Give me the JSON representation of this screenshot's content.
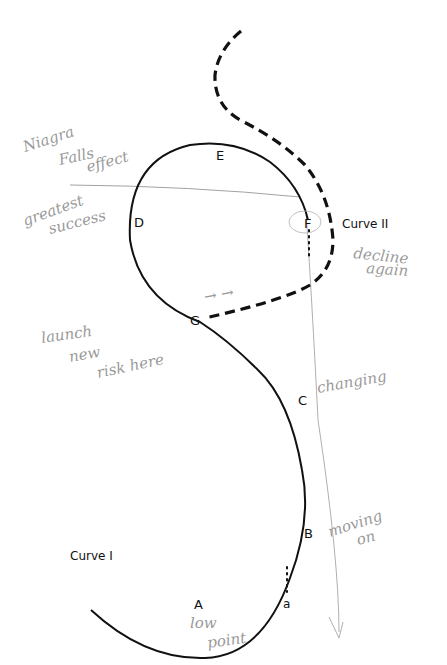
{
  "diagram": {
    "type": "sigmoid-curve-diagram",
    "curves": [
      {
        "name": "Curve I",
        "style": "solid"
      },
      {
        "name": "Curve II",
        "style": "dashed"
      }
    ],
    "points": {
      "A": "A",
      "B": "B",
      "C": "C",
      "D": "D",
      "E": "E",
      "F": "F",
      "G": "G",
      "a": "a"
    },
    "curve_labels": {
      "curve1": "Curve I",
      "curve2": "Curve II"
    },
    "annotations": {
      "niagara_1": "Niagra",
      "niagara_2": "Falls",
      "niagara_3": "effect",
      "greatest_1": "greatest",
      "greatest_2": "success",
      "launch_1": "launch",
      "launch_2": "new",
      "launch_3": "risk here",
      "arrows": "→ →",
      "changing": "changing",
      "decline_1": "decline",
      "decline_2": "again",
      "moving_1": "moving",
      "moving_2": "on",
      "low_1": "low",
      "low_2": "point"
    },
    "colors": {
      "curve": "#111111",
      "handwriting": "#9a9a9a",
      "pencil_line": "#8a8a8a"
    }
  }
}
